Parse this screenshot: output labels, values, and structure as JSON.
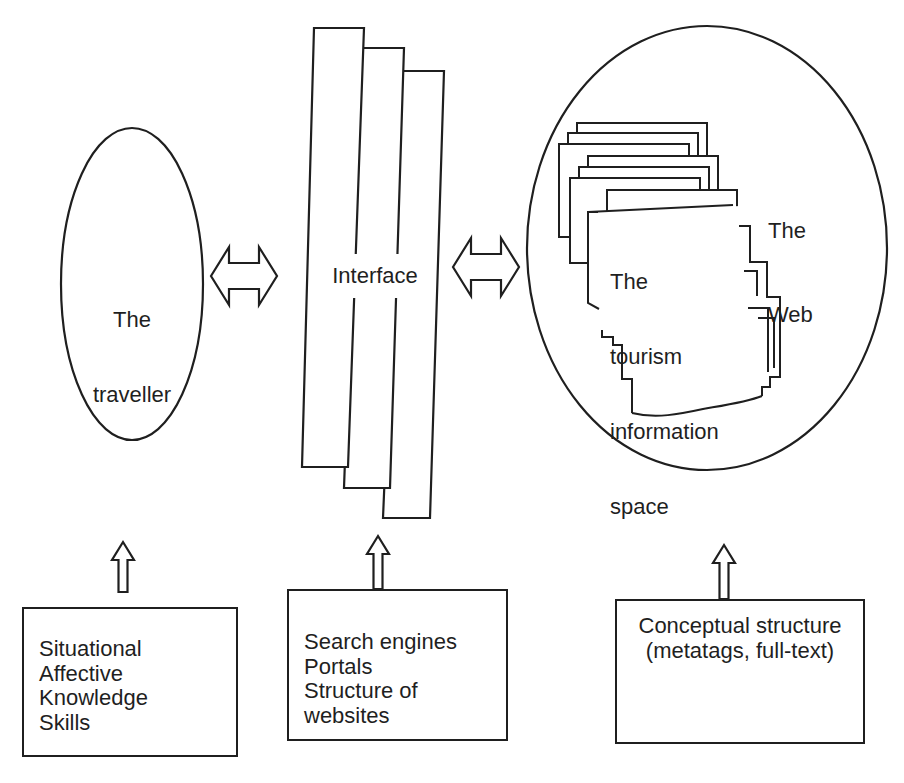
{
  "figure": {
    "nodes": {
      "traveller": {
        "lines": [
          "The",
          "traveller"
        ]
      },
      "interface": {
        "label": "Interface"
      },
      "web": {
        "lines": [
          "The",
          "Web"
        ]
      },
      "tourism_space": {
        "lines": [
          "The",
          "tourism",
          "information",
          "space"
        ]
      }
    },
    "factor_boxes": {
      "traveller_factors": {
        "lines": [
          "Situational",
          "Affective",
          "Knowledge",
          "Skills"
        ]
      },
      "interface_factors": {
        "lines": [
          "Search engines",
          "Portals",
          "Structure of websites"
        ]
      },
      "web_factors": {
        "lines": [
          "Conceptual structure",
          "(metatags, full-text)"
        ]
      }
    },
    "colors": {
      "ink": "#1f1f1f",
      "paper": "#ffffff"
    }
  }
}
